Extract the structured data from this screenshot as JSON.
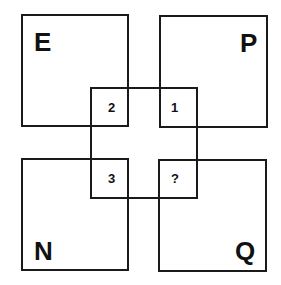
{
  "puzzle": {
    "squares": {
      "top_left": {
        "letter": "E"
      },
      "top_right": {
        "letter": "P"
      },
      "bottom_left": {
        "letter": "N"
      },
      "bottom_right": {
        "letter": "Q"
      }
    },
    "center": {
      "cells": [
        "2",
        "1",
        "3",
        "?"
      ]
    }
  },
  "colors": {
    "line": "#1a1a1a",
    "background": "#ffffff"
  }
}
